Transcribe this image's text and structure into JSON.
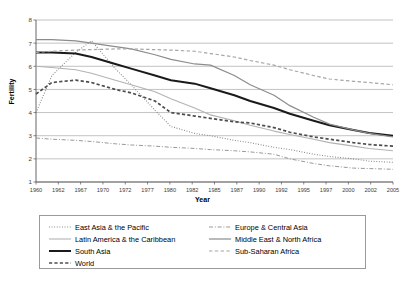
{
  "chart_data": {
    "type": "line",
    "title": "",
    "xlabel": "Year",
    "ylabel": "Fertility",
    "xlim": [
      1960,
      2005
    ],
    "ylim": [
      1,
      8
    ],
    "yticks": [
      1,
      2,
      3,
      4,
      5,
      6,
      7,
      8
    ],
    "grid": "horizontal",
    "legend_position": "bottom",
    "xticks": [
      "1960",
      "1962",
      "1967",
      "1970",
      "1972",
      "1977",
      "1980",
      "1982",
      "1985",
      "1987",
      "1990",
      "1992",
      "1995",
      "1997",
      "2000",
      "2002",
      "2005"
    ],
    "x": [
      1960,
      1962,
      1965,
      1967,
      1970,
      1972,
      1975,
      1977,
      1980,
      1982,
      1985,
      1987,
      1990,
      1992,
      1995,
      1997,
      2000,
      2002,
      2005
    ],
    "series": [
      {
        "name": "East Asia & the Pacific",
        "style": "dotted",
        "color": "#808080",
        "width": 1.1,
        "values": [
          4.0,
          5.6,
          6.6,
          7.1,
          5.9,
          5.2,
          4.1,
          3.4,
          3.1,
          3.0,
          2.8,
          2.7,
          2.5,
          2.4,
          2.2,
          2.1,
          2.0,
          1.9,
          1.85
        ]
      },
      {
        "name": "Latin America & the Caribbean",
        "style": "solid-light",
        "color": "#b3b3b3",
        "width": 1.1,
        "values": [
          6.0,
          5.95,
          5.85,
          5.7,
          5.4,
          5.2,
          4.9,
          4.6,
          4.2,
          3.9,
          3.65,
          3.45,
          3.2,
          3.05,
          2.85,
          2.7,
          2.55,
          2.45,
          2.35
        ]
      },
      {
        "name": "South Asia",
        "style": "solid-bold",
        "color": "#1a1a1a",
        "width": 2.0,
        "values": [
          6.6,
          6.6,
          6.55,
          6.4,
          6.1,
          5.9,
          5.6,
          5.4,
          5.25,
          5.05,
          4.75,
          4.5,
          4.2,
          3.95,
          3.65,
          3.45,
          3.25,
          3.12,
          3.0
        ]
      },
      {
        "name": "World",
        "style": "dashed-bold",
        "color": "#4d4d4d",
        "width": 1.7,
        "values": [
          4.8,
          5.3,
          5.4,
          5.3,
          5.0,
          4.85,
          4.5,
          4.0,
          3.85,
          3.75,
          3.6,
          3.55,
          3.35,
          3.15,
          2.95,
          2.85,
          2.7,
          2.62,
          2.55
        ]
      },
      {
        "name": "Europe & Central Asia",
        "style": "dash-dot",
        "color": "#999999",
        "width": 1.0,
        "values": [
          2.9,
          2.85,
          2.8,
          2.75,
          2.65,
          2.6,
          2.55,
          2.5,
          2.45,
          2.4,
          2.35,
          2.3,
          2.2,
          2.0,
          1.8,
          1.7,
          1.6,
          1.58,
          1.55
        ]
      },
      {
        "name": "Middle East & North Africa",
        "style": "solid-mid",
        "color": "#8c8c8c",
        "width": 1.2,
        "values": [
          7.15,
          7.15,
          7.1,
          7.0,
          6.85,
          6.75,
          6.5,
          6.3,
          6.1,
          6.05,
          5.6,
          5.2,
          4.75,
          4.3,
          3.8,
          3.5,
          3.25,
          3.1,
          2.95
        ]
      },
      {
        "name": "Sub-Saharan Africa",
        "style": "dashed-light",
        "color": "#a6a6a6",
        "width": 1.2,
        "values": [
          6.6,
          6.65,
          6.7,
          6.72,
          6.75,
          6.75,
          6.72,
          6.7,
          6.65,
          6.55,
          6.4,
          6.25,
          6.05,
          5.85,
          5.6,
          5.45,
          5.35,
          5.3,
          5.2
        ]
      }
    ]
  },
  "axes": {
    "ylabel": "Fertility",
    "xlabel": "Year"
  },
  "legend": {
    "left_column": [
      {
        "label": "East Asia & the Pacific"
      },
      {
        "label": "Latin America & the Caribbean"
      },
      {
        "label": "South Asia"
      },
      {
        "label": "World"
      }
    ],
    "right_column": [
      {
        "label": "Europe & Central Asia"
      },
      {
        "label": "Middle East & North Africa"
      },
      {
        "label": "Sub-Saharan Africa"
      }
    ]
  }
}
